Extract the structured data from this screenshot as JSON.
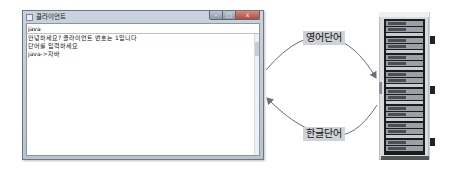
{
  "window": {
    "title": "클라이언트",
    "controls": {
      "minimize": "–",
      "maximize": "□",
      "close": "x"
    },
    "input_value": "java",
    "output_lines": [
      "안녕하세요? 클라이언트 번호는 1입니다",
      "단어를 입력하세요",
      "java->자바"
    ]
  },
  "diagram": {
    "top_arrow_label": "영어단어",
    "bottom_arrow_label": "한글단어",
    "arrow_color": "#6b6f73",
    "label_bg": "#cfd3d6"
  },
  "server": {
    "name": "server-rack"
  }
}
